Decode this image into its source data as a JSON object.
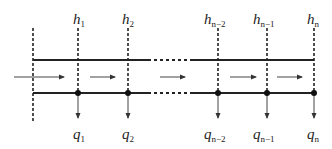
{
  "diagram": {
    "type": "channel-with-nodes",
    "colors": {
      "line": "#222222",
      "arrow": "#444444",
      "background": "#ffffff"
    },
    "top_labels": [
      {
        "base": "h",
        "sub": "1",
        "x": 78
      },
      {
        "base": "h",
        "sub": "2",
        "x": 128
      },
      {
        "base": "h",
        "sub": "n−2",
        "x": 218
      },
      {
        "base": "h",
        "sub": "n−1",
        "x": 267
      },
      {
        "base": "h",
        "sub": "n",
        "x": 314
      }
    ],
    "bottom_labels": [
      {
        "base": "q",
        "sub": "1",
        "x": 78
      },
      {
        "base": "q",
        "sub": "2",
        "x": 128
      },
      {
        "base": "q",
        "sub": "n−2",
        "x": 218
      },
      {
        "base": "q",
        "sub": "n−1",
        "x": 267
      },
      {
        "base": "q",
        "sub": "n",
        "x": 314
      }
    ],
    "flow_direction": "left-to-right"
  }
}
